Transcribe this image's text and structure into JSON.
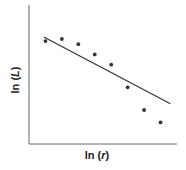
{
  "chart_data": {
    "type": "scatter",
    "title": "",
    "xlabel": "ln (r)",
    "ylabel": "ln (L)",
    "grid": false,
    "legend": null,
    "ticks": false,
    "points": [
      {
        "x": 1,
        "y": 8.5
      },
      {
        "x": 2,
        "y": 8.7
      },
      {
        "x": 3,
        "y": 8.2
      },
      {
        "x": 4,
        "y": 7.2
      },
      {
        "x": 5,
        "y": 6.2
      },
      {
        "x": 6,
        "y": 4.0
      },
      {
        "x": 7,
        "y": 1.8
      },
      {
        "x": 8,
        "y": 0.6
      }
    ],
    "fit_line": {
      "x0": 0.9,
      "y0": 8.9,
      "x1": 8.6,
      "y1": 2.4
    },
    "xlim": [
      0,
      9
    ],
    "ylim": [
      -1.5,
      12
    ],
    "colors": {
      "points": "#333333",
      "line": "#333333",
      "axes": "#555555"
    }
  },
  "labels": {
    "x": "ln (",
    "x_var": "r",
    "x_close": ")",
    "y": "ln (",
    "y_var": "L",
    "y_close": ")"
  }
}
